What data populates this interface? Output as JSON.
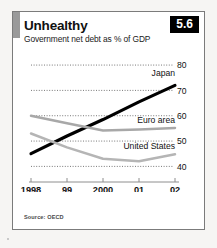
{
  "card": {
    "title": "Unhealthy",
    "subtitle": "Government net debt as % of GDP",
    "badge": "5.6",
    "source": "Source: OECD"
  },
  "chart_data": {
    "type": "line",
    "title": "Unhealthy",
    "subtitle": "Government net debt as % of GDP",
    "xlabel": "",
    "ylabel": "",
    "categories": [
      "1998",
      "99",
      "2000",
      "01",
      "02"
    ],
    "x_tick_labels": [
      "1998",
      "99",
      "2000",
      "01",
      "02"
    ],
    "y_tick_labels": [
      "40",
      "50",
      "60",
      "70",
      "80"
    ],
    "y_ticks": [
      40,
      50,
      60,
      70,
      80
    ],
    "ylim": [
      37,
      82
    ],
    "xlim": [
      1998,
      2002
    ],
    "y_axis_side": "right",
    "grid": "horizontal-dotted",
    "legend": "inline-labels-right",
    "series": [
      {
        "name": "Japan",
        "color": "#000000",
        "values": [
          45.0,
          52.0,
          58.5,
          65.5,
          72.0
        ]
      },
      {
        "name": "Euro area",
        "color": "#a8a8a8",
        "values": [
          60.0,
          57.0,
          54.2,
          54.6,
          55.2
        ]
      },
      {
        "name": "United States",
        "color": "#b5b5b5",
        "values": [
          53.0,
          47.5,
          43.0,
          42.0,
          44.8
        ]
      }
    ]
  }
}
